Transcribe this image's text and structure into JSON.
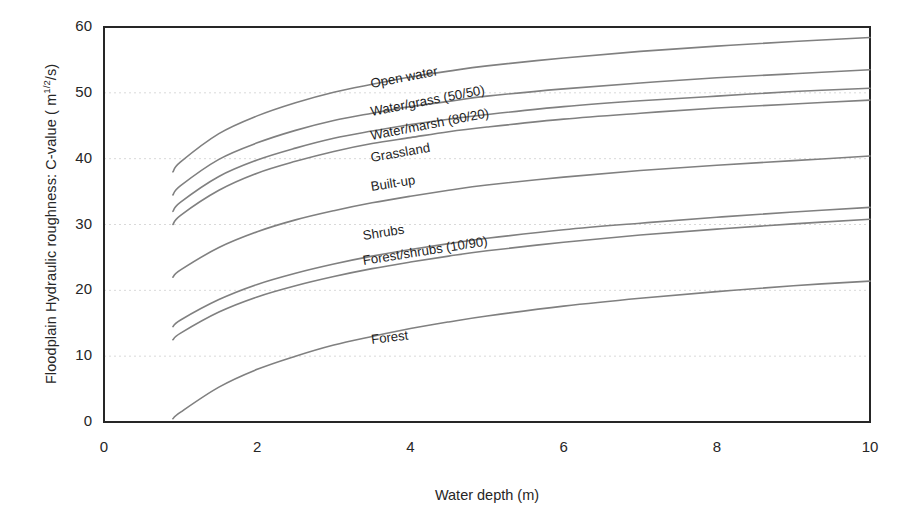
{
  "chart_data": {
    "type": "line",
    "title": "",
    "xlabel": "Water depth (m)",
    "ylabel_plain": "Floodplain Hydraulic roughness: C-value ( m1/2/s)",
    "ylabel_prefix": "Floodplain Hydraulic roughness: C-value ( m",
    "ylabel_exponent": "1/2",
    "ylabel_suffix": "/s)",
    "xlim": [
      0,
      10
    ],
    "ylim": [
      0,
      60
    ],
    "xticks": [
      "0",
      "2",
      "4",
      "6",
      "8",
      "10"
    ],
    "yticks": [
      "0",
      "10",
      "20",
      "30",
      "40",
      "50",
      "60"
    ],
    "grid": "horizontal dotted",
    "grid_color": "#d9d9d9",
    "line_color": "#808080",
    "axis_color": "#262626",
    "legend": "inline curve labels",
    "x": [
      0.9,
      1,
      1.5,
      2,
      2.5,
      3,
      3.5,
      4,
      4.5,
      5,
      6,
      7,
      8,
      9,
      10
    ],
    "series": [
      {
        "name": "Open water",
        "label": "Open water",
        "label_x": 3.5,
        "label_y": 50.5,
        "label_rot": -11,
        "values": [
          38.0,
          39.5,
          43.8,
          46.5,
          48.5,
          50.1,
          51.3,
          52.4,
          53.3,
          54.1,
          55.3,
          56.3,
          57.1,
          57.8,
          58.4
        ]
      },
      {
        "name": "Water/grass (50/50)",
        "label": "Water/grass (50/50)",
        "label_x": 3.5,
        "label_y": 46.2,
        "label_rot": -11,
        "values": [
          34.5,
          35.9,
          39.9,
          42.4,
          44.3,
          45.8,
          46.9,
          47.9,
          48.7,
          49.5,
          50.6,
          51.5,
          52.3,
          52.9,
          53.5
        ]
      },
      {
        "name": "Water/marsh (80/20)",
        "label": "Water/marsh (80/20)",
        "label_x": 3.5,
        "label_y": 42.6,
        "label_rot": -11,
        "values": [
          32.0,
          33.4,
          37.3,
          39.8,
          41.6,
          43.1,
          44.2,
          45.2,
          46.0,
          46.7,
          47.9,
          48.8,
          49.5,
          50.2,
          50.7
        ]
      },
      {
        "name": "Grassland",
        "label": "Grassland",
        "label_x": 3.5,
        "label_y": 39.2,
        "label_rot": -10,
        "values": [
          30.0,
          31.4,
          35.2,
          37.8,
          39.6,
          41.1,
          42.3,
          43.2,
          44.1,
          44.8,
          46.0,
          46.9,
          47.7,
          48.3,
          48.9
        ]
      },
      {
        "name": "Built-up",
        "label": "Built-up",
        "label_x": 3.5,
        "label_y": 34.8,
        "label_rot": -9,
        "values": [
          22.0,
          23.1,
          26.5,
          28.9,
          30.7,
          32.1,
          33.3,
          34.3,
          35.2,
          36.0,
          37.2,
          38.2,
          39.0,
          39.7,
          40.4
        ]
      },
      {
        "name": "Shrubs",
        "label": "Shrubs",
        "label_x": 3.4,
        "label_y": 27.3,
        "label_rot": -9,
        "values": [
          14.5,
          15.5,
          18.6,
          20.9,
          22.6,
          24.0,
          25.2,
          26.2,
          27.1,
          27.9,
          29.2,
          30.2,
          31.1,
          31.9,
          32.6
        ]
      },
      {
        "name": "Forest/shrubs (10/90)",
        "label": "Forest/shrubs (10/90)",
        "label_x": 3.4,
        "label_y": 23.5,
        "label_rot": -9,
        "values": [
          12.5,
          13.5,
          16.7,
          19.0,
          20.7,
          22.1,
          23.3,
          24.3,
          25.2,
          26.0,
          27.3,
          28.4,
          29.3,
          30.1,
          30.8
        ]
      },
      {
        "name": "Forest",
        "label": "Forest",
        "label_x": 3.5,
        "label_y": 11.5,
        "label_rot": -7,
        "values": [
          0.5,
          1.5,
          5.3,
          8.0,
          10.0,
          11.7,
          13.0,
          14.2,
          15.2,
          16.1,
          17.6,
          18.8,
          19.8,
          20.7,
          21.4
        ]
      }
    ]
  }
}
